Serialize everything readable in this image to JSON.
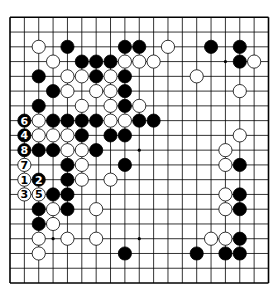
{
  "board": {
    "size": 19,
    "colors": {
      "background": "#ffffff",
      "line": "#000000",
      "black": "#000000",
      "white": "#ffffff"
    },
    "star_points": [
      [
        3,
        3
      ],
      [
        9,
        3
      ],
      [
        15,
        3
      ],
      [
        3,
        9
      ],
      [
        9,
        9
      ],
      [
        15,
        9
      ],
      [
        3,
        15
      ],
      [
        9,
        15
      ],
      [
        15,
        15
      ]
    ],
    "black_stones": [
      [
        4,
        2
      ],
      [
        8,
        2
      ],
      [
        9,
        2
      ],
      [
        14,
        2
      ],
      [
        16,
        2
      ],
      [
        5,
        3
      ],
      [
        6,
        3
      ],
      [
        7,
        3
      ],
      [
        16,
        3
      ],
      [
        2,
        4
      ],
      [
        6,
        4
      ],
      [
        8,
        4
      ],
      [
        3,
        5
      ],
      [
        8,
        5
      ],
      [
        2,
        6
      ],
      [
        8,
        6
      ],
      [
        3,
        7
      ],
      [
        4,
        7
      ],
      [
        5,
        7
      ],
      [
        6,
        7
      ],
      [
        9,
        7
      ],
      [
        10,
        7
      ],
      [
        5,
        8
      ],
      [
        7,
        8
      ],
      [
        8,
        8
      ],
      [
        2,
        9
      ],
      [
        3,
        9
      ],
      [
        6,
        9
      ],
      [
        4,
        10
      ],
      [
        8,
        10
      ],
      [
        16,
        10
      ],
      [
        4,
        11
      ],
      [
        3,
        12
      ],
      [
        4,
        12
      ],
      [
        16,
        12
      ],
      [
        2,
        13
      ],
      [
        4,
        13
      ],
      [
        16,
        13
      ],
      [
        2,
        14
      ],
      [
        16,
        15
      ],
      [
        8,
        16
      ],
      [
        13,
        16
      ],
      [
        15,
        16
      ],
      [
        16,
        16
      ]
    ],
    "white_stones": [
      [
        2,
        2
      ],
      [
        11,
        2
      ],
      [
        3,
        3
      ],
      [
        8,
        3
      ],
      [
        9,
        3
      ],
      [
        10,
        3
      ],
      [
        17,
        3
      ],
      [
        4,
        4
      ],
      [
        5,
        4
      ],
      [
        7,
        4
      ],
      [
        13,
        4
      ],
      [
        4,
        5
      ],
      [
        6,
        5
      ],
      [
        7,
        5
      ],
      [
        16,
        5
      ],
      [
        5,
        6
      ],
      [
        7,
        6
      ],
      [
        9,
        6
      ],
      [
        2,
        7
      ],
      [
        7,
        7
      ],
      [
        8,
        7
      ],
      [
        2,
        8
      ],
      [
        3,
        8
      ],
      [
        4,
        8
      ],
      [
        16,
        8
      ],
      [
        4,
        9
      ],
      [
        5,
        9
      ],
      [
        15,
        9
      ],
      [
        5,
        10
      ],
      [
        15,
        10
      ],
      [
        5,
        11
      ],
      [
        7,
        11
      ],
      [
        15,
        12
      ],
      [
        3,
        13
      ],
      [
        6,
        13
      ],
      [
        15,
        13
      ],
      [
        3,
        14
      ],
      [
        2,
        15
      ],
      [
        4,
        15
      ],
      [
        6,
        15
      ],
      [
        14,
        15
      ],
      [
        15,
        15
      ],
      [
        2,
        16
      ]
    ],
    "numbered_moves": [
      {
        "number": "1",
        "color": "white",
        "col": 1,
        "row": 11
      },
      {
        "number": "2",
        "color": "black",
        "col": 2,
        "row": 11
      },
      {
        "number": "3",
        "color": "white",
        "col": 1,
        "row": 12
      },
      {
        "number": "4",
        "color": "black",
        "col": 1,
        "row": 8
      },
      {
        "number": "5",
        "color": "white",
        "col": 2,
        "row": 12
      },
      {
        "number": "6",
        "color": "black",
        "col": 1,
        "row": 7
      },
      {
        "number": "7",
        "color": "white",
        "col": 1,
        "row": 10
      },
      {
        "number": "8",
        "color": "black",
        "col": 1,
        "row": 9
      }
    ]
  }
}
